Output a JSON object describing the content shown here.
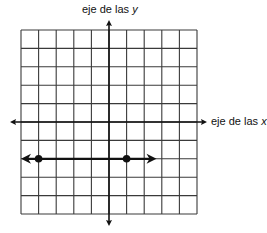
{
  "labels": {
    "y_axis_prefix": "eje de las",
    "y_axis_var": "y",
    "x_axis_prefix": "eje de las",
    "x_axis_var": "x"
  },
  "colors": {
    "grid": "#3a3a3a",
    "axis": "#111111",
    "line": "#111111",
    "point": "#111111",
    "background": "#ffffff"
  },
  "chart_data": {
    "type": "line",
    "title": "",
    "xlabel": "eje de las x",
    "ylabel": "eje de las y",
    "xlim": [
      -5,
      5
    ],
    "ylim": [
      -5,
      5
    ],
    "grid": true,
    "grid_cells": 10,
    "tick_labels": false,
    "series": [
      {
        "name": "horizontal line y = -2",
        "kind": "line-both-arrows",
        "points": [
          {
            "x": -4,
            "y": -2
          },
          {
            "x": 1,
            "y": -2
          }
        ],
        "arrow_extent": {
          "left_x": -5,
          "right_x": 2.7
        }
      }
    ]
  }
}
